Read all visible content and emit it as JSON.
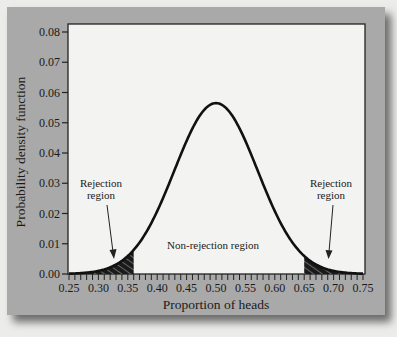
{
  "chart_data": {
    "type": "area",
    "title": "",
    "xlabel": "Proportion of heads",
    "ylabel": "Probability density function",
    "xlim": [
      0.25,
      0.75
    ],
    "ylim": [
      0.0,
      0.08
    ],
    "x_ticks": [
      "0.25",
      "0.30",
      "0.35",
      "0.40",
      "0.45",
      "0.50",
      "0.55",
      "0.60",
      "0.65",
      "0.70",
      "0.75"
    ],
    "y_ticks": [
      "0.00",
      "0.01",
      "0.02",
      "0.03",
      "0.04",
      "0.05",
      "0.06",
      "0.07",
      "0.08"
    ],
    "x_minor_tick_step": 0.01,
    "grid": false,
    "legend": null,
    "distribution": {
      "kind": "normal",
      "mean": 0.5,
      "sd": 0.0707,
      "peak": 0.0565
    },
    "series": [
      {
        "name": "Probability density",
        "x": [
          0.25,
          0.28,
          0.3,
          0.32,
          0.34,
          0.36,
          0.38,
          0.4,
          0.42,
          0.44,
          0.46,
          0.48,
          0.5,
          0.52,
          0.54,
          0.56,
          0.58,
          0.6,
          0.62,
          0.64,
          0.66,
          0.68,
          0.7,
          0.72,
          0.75
        ],
        "values": [
          0.0002,
          0.0005,
          0.001,
          0.0022,
          0.0043,
          0.0079,
          0.0132,
          0.0208,
          0.0297,
          0.0394,
          0.0479,
          0.0543,
          0.0565,
          0.0543,
          0.0479,
          0.0394,
          0.0297,
          0.0208,
          0.0132,
          0.0079,
          0.0043,
          0.0022,
          0.001,
          0.0005,
          0.0002
        ]
      }
    ],
    "shaded_regions": [
      {
        "name": "Rejection region (left)",
        "x_from": 0.25,
        "x_to": 0.36
      },
      {
        "name": "Rejection region (right)",
        "x_from": 0.65,
        "x_to": 0.75
      }
    ],
    "annotations": [
      {
        "text": "Rejection\nregion",
        "x": 0.31,
        "y": 0.029,
        "arrow_to": [
          0.33,
          0.005
        ]
      },
      {
        "text": "Non-rejection region",
        "x": 0.5,
        "y": 0.009
      },
      {
        "text": "Rejection\nregion",
        "x": 0.69,
        "y": 0.029,
        "arrow_to": [
          0.68,
          0.005
        ]
      }
    ]
  },
  "labels": {
    "xlabel": "Proportion of heads",
    "ylabel": "Probability density function",
    "left_rejection_line1": "Rejection",
    "left_rejection_line2": "region",
    "right_rejection_line1": "Rejection",
    "right_rejection_line2": "region",
    "non_rejection": "Non-rejection region"
  },
  "colors": {
    "panel": "#a9a9a9",
    "plot_bg": "#f3f3f1",
    "curve": "#111111",
    "shade": "#1a1a1a"
  }
}
